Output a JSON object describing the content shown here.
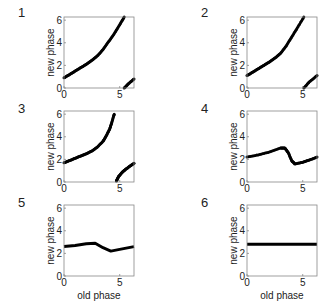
{
  "figure": {
    "panels": [
      {
        "label": "1"
      },
      {
        "label": "2"
      },
      {
        "label": "3"
      },
      {
        "label": "4"
      },
      {
        "label": "5"
      },
      {
        "label": "6"
      }
    ],
    "ylabel": "new phase",
    "xlabel": "old phase",
    "xticks": [
      "0",
      "5"
    ],
    "yticks": [
      "0",
      "2",
      "4",
      "6"
    ]
  },
  "chart_data": [
    {
      "type": "scatter",
      "title": "1",
      "xlabel": "",
      "ylabel": "new phase",
      "xlim": [
        0,
        6.28
      ],
      "ylim": [
        0,
        6.28
      ],
      "grid": false,
      "xticks": [
        0,
        5
      ],
      "yticks": [
        0,
        2,
        4,
        6
      ],
      "series": [
        {
          "name": "branch-a",
          "x": [
            0,
            0.5,
            1,
            1.5,
            2,
            2.5,
            3,
            3.5,
            4,
            4.5,
            5,
            5.4
          ],
          "y": [
            0.9,
            1.2,
            1.5,
            1.8,
            2.1,
            2.45,
            2.85,
            3.4,
            4.1,
            4.8,
            5.6,
            6.28
          ]
        },
        {
          "name": "branch-b",
          "x": [
            5.4,
            5.8,
            6.28
          ],
          "y": [
            0,
            0.4,
            0.8
          ]
        }
      ]
    },
    {
      "type": "scatter",
      "title": "2",
      "xlabel": "",
      "ylabel": "new phase",
      "xlim": [
        0,
        6.28
      ],
      "ylim": [
        0,
        6.28
      ],
      "grid": false,
      "xticks": [
        0,
        5
      ],
      "yticks": [
        0,
        2,
        4,
        6
      ],
      "series": [
        {
          "name": "branch-a",
          "x": [
            0,
            0.5,
            1,
            1.5,
            2,
            2.5,
            3,
            3.5,
            4,
            4.5,
            5.1
          ],
          "y": [
            1.1,
            1.4,
            1.7,
            2.0,
            2.3,
            2.65,
            3.05,
            3.7,
            4.5,
            5.3,
            6.28
          ]
        },
        {
          "name": "branch-b",
          "x": [
            5.1,
            5.6,
            6.28
          ],
          "y": [
            0,
            0.55,
            1.1
          ]
        }
      ]
    },
    {
      "type": "scatter",
      "title": "3",
      "xlabel": "",
      "ylabel": "new phase",
      "xlim": [
        0,
        6.28
      ],
      "ylim": [
        0,
        6.28
      ],
      "grid": false,
      "xticks": [
        0,
        5
      ],
      "yticks": [
        0,
        2,
        4,
        6
      ],
      "series": [
        {
          "name": "branch-a",
          "x": [
            0,
            0.5,
            1,
            1.5,
            2,
            2.5,
            3,
            3.5,
            3.8,
            4.1,
            4.3,
            4.5
          ],
          "y": [
            1.7,
            1.9,
            2.1,
            2.3,
            2.5,
            2.75,
            3.1,
            3.6,
            4.1,
            4.7,
            5.3,
            6.0
          ]
        },
        {
          "name": "branch-b",
          "x": [
            4.7,
            4.9,
            5.2,
            5.5,
            5.9,
            6.28
          ],
          "y": [
            0.1,
            0.5,
            0.85,
            1.1,
            1.4,
            1.65
          ]
        }
      ]
    },
    {
      "type": "scatter",
      "title": "4",
      "xlabel": "",
      "ylabel": "new phase",
      "xlim": [
        0,
        6.28
      ],
      "ylim": [
        0,
        6.28
      ],
      "grid": false,
      "xticks": [
        0,
        5
      ],
      "yticks": [
        0,
        2,
        4,
        6
      ],
      "series": [
        {
          "name": "response",
          "x": [
            0,
            1,
            2,
            3,
            3.4,
            3.7,
            4.0,
            4.3,
            5,
            5.6,
            6.28
          ],
          "y": [
            2.2,
            2.4,
            2.65,
            3.0,
            3.0,
            2.6,
            1.9,
            1.6,
            1.75,
            1.95,
            2.2
          ]
        }
      ]
    },
    {
      "type": "line",
      "title": "5",
      "xlabel": "old phase",
      "ylabel": "new phase",
      "xlim": [
        0,
        6.28
      ],
      "ylim": [
        0,
        6.28
      ],
      "grid": false,
      "xticks": [
        0,
        5
      ],
      "yticks": [
        0,
        2,
        4,
        6
      ],
      "series": [
        {
          "name": "response",
          "x": [
            0,
            1,
            2,
            2.8,
            3.5,
            4.2,
            5,
            6.28
          ],
          "y": [
            2.6,
            2.7,
            2.85,
            2.9,
            2.5,
            2.2,
            2.35,
            2.6
          ]
        }
      ]
    },
    {
      "type": "line",
      "title": "6",
      "xlabel": "old phase",
      "ylabel": "new phase",
      "xlim": [
        0,
        6.28
      ],
      "ylim": [
        0,
        6.28
      ],
      "grid": false,
      "xticks": [
        0,
        5
      ],
      "yticks": [
        0,
        2,
        4,
        6
      ],
      "series": [
        {
          "name": "response",
          "x": [
            0,
            6.28
          ],
          "y": [
            2.8,
            2.8
          ]
        }
      ]
    }
  ]
}
